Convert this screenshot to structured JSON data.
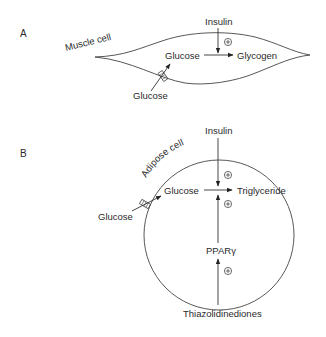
{
  "panels": [
    {
      "label": "A",
      "cell_label": "Muscle cell",
      "outside_substrate": "Glucose",
      "inside_substrate": "Glucose",
      "product": "Glycogen",
      "regulator": "Insulin",
      "regulator_effect": "+"
    },
    {
      "label": "B",
      "cell_label": "Adipose cell",
      "outside_substrate": "Glucose",
      "inside_substrate": "Glucose",
      "product": "Triglyceride",
      "regulator": "Insulin",
      "regulator_effect": "+",
      "second_effect": "+",
      "receptor": "PPARγ",
      "receptor_effect": "+",
      "drug": "Thiazolidinediones"
    }
  ],
  "symbols": {
    "stimulation": "+",
    "transporter": "glucose-transporter-icon"
  }
}
